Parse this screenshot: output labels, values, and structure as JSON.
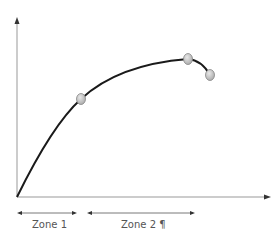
{
  "diagram": {
    "type": "curve",
    "zones": [
      {
        "label": "Zone 1",
        "x_start": 17,
        "x_end": 77
      },
      {
        "label": "Zone 2 ¶",
        "x_start": 87,
        "x_end": 195
      }
    ],
    "points": [
      {
        "x": 81,
        "y": 99
      },
      {
        "x": 188,
        "y": 59
      },
      {
        "x": 210,
        "y": 75
      }
    ],
    "colors": {
      "curve": "#1a1a1a",
      "axis": "#888888",
      "point_fill": "#c8c8c8",
      "point_stroke": "#888888",
      "label": "#555555"
    }
  }
}
